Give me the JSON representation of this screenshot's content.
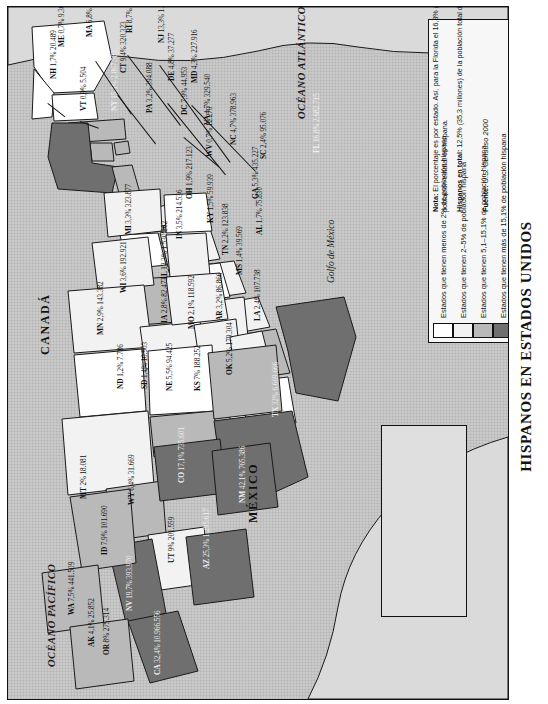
{
  "title": "HISPANOS EN ESTADOS UNIDOS",
  "colors": {
    "bin_lt2": "#ffffff",
    "bin_2_5": "#f2f2f2",
    "bin_5_15": "#b9b9b9",
    "bin_gt15": "#6f6f6f",
    "ocean": "#c9c9c9",
    "border": "#1a1a1a"
  },
  "legend": {
    "items": [
      {
        "swatch": "#ffffff",
        "label": "Estados que tienen menos de 2% de población hispana"
      },
      {
        "swatch": "#f2f2f2",
        "label": "Estados que tienen 2–5% de población hispana"
      },
      {
        "swatch": "#b9b9b9",
        "label": "Estados que tienen 5,1–15,1% de población hispana"
      },
      {
        "swatch": "#6f6f6f",
        "label": "Estados que tienen más de 15,1% de población hispana"
      }
    ],
    "note_label": "Nota:",
    "note_text": "El porcentaje es por estado. Así, para la Florida el 16,8% (2.682.715 personas) de la población estatal es hispana.",
    "total_label": "Hispanos en total:",
    "total_text": "12,5% (35,3 millones) de la población total de Estados Unidos",
    "source_label": "Fuente:",
    "source_text": "U.S. Censuso 2000"
  },
  "geography": {
    "ocean_atlantic": "OCÉANO ATLÁNTICO",
    "ocean_pacific": "OCÉANO PACÍFICO",
    "gulf": "Golfo de México",
    "canada": "CANADÁ",
    "mexico": "MÉXICO"
  },
  "chart_data": {
    "type": "map",
    "title": "HISPANOS EN ESTADOS UNIDOS",
    "unit": "porcentaje de población hispana por estado",
    "source": "U.S. Censuso 2000",
    "bins": [
      "<2%",
      "2–5%",
      "5,1–15,1%",
      ">15,1%"
    ],
    "states": [
      {
        "code": "WA",
        "pct": "7,5%",
        "count": "441.509",
        "bin": 2,
        "x": 60,
        "y": 608
      },
      {
        "code": "OR",
        "pct": "8%",
        "count": "275.314",
        "bin": 2,
        "x": 95,
        "y": 648
      },
      {
        "code": "CA",
        "pct": "32,4%",
        "count": "10.966.556",
        "bin": 3,
        "x": 146,
        "y": 668
      },
      {
        "code": "NV",
        "pct": "19,7%",
        "count": "393.970",
        "bin": 3,
        "x": 118,
        "y": 604
      },
      {
        "code": "ID",
        "pct": "7,9%",
        "count": "101.690",
        "bin": 2,
        "x": 93,
        "y": 548
      },
      {
        "code": "MT",
        "pct": "2%",
        "count": "18.081",
        "bin": 1,
        "x": 72,
        "y": 492
      },
      {
        "code": "WY",
        "pct": "6,4%",
        "count": "31.669",
        "bin": 2,
        "x": 120,
        "y": 498
      },
      {
        "code": "UT",
        "pct": "9%",
        "count": "201.559",
        "bin": 2,
        "x": 160,
        "y": 556
      },
      {
        "code": "AZ",
        "pct": "25,3%",
        "count": "1.295.617",
        "bin": 3,
        "x": 195,
        "y": 562
      },
      {
        "code": "CO",
        "pct": "17,1%",
        "count": "735.601",
        "bin": 3,
        "x": 170,
        "y": 476
      },
      {
        "code": "NM",
        "pct": "42,1%",
        "count": "765.386",
        "bin": 3,
        "x": 231,
        "y": 496
      },
      {
        "code": "ND",
        "pct": "1,2%",
        "count": "7.786",
        "bin": 0,
        "x": 109,
        "y": 382
      },
      {
        "code": "SD",
        "pct": "1,4%",
        "count": "10.903",
        "bin": 0,
        "x": 133,
        "y": 382
      },
      {
        "code": "NE",
        "pct": "5,5%",
        "count": "94.425",
        "bin": 2,
        "x": 158,
        "y": 384
      },
      {
        "code": "KS",
        "pct": "7%",
        "count": "188.252",
        "bin": 2,
        "x": 186,
        "y": 384
      },
      {
        "code": "OK",
        "pct": "5,2%",
        "count": "179.304",
        "bin": 2,
        "x": 218,
        "y": 368
      },
      {
        "code": "TX",
        "pct": "32%",
        "count": "6.669.666",
        "bin": 3,
        "x": 264,
        "y": 410
      },
      {
        "code": "MN",
        "pct": "2,9%",
        "count": "143.382",
        "bin": 1,
        "x": 89,
        "y": 328
      },
      {
        "code": "IA",
        "pct": "2,8%",
        "count": "82.473",
        "bin": 1,
        "x": 153,
        "y": 316
      },
      {
        "code": "MO",
        "pct": "2,1%",
        "count": "118.592",
        "bin": 1,
        "x": 180,
        "y": 322
      },
      {
        "code": "AR",
        "pct": "3,2%",
        "count": "86.866",
        "bin": 1,
        "x": 208,
        "y": 314
      },
      {
        "code": "LA",
        "pct": "2,4%",
        "count": "107.738",
        "bin": 1,
        "x": 246,
        "y": 314
      },
      {
        "code": "WI",
        "pct": "3,6%",
        "count": "192.921",
        "bin": 1,
        "x": 112,
        "y": 286
      },
      {
        "code": "IL",
        "pct": "12,3%",
        "count": "1.530.262",
        "bin": 2,
        "x": 153,
        "y": 272
      },
      {
        "code": "MS",
        "pct": "1,4%",
        "count": "39.569",
        "bin": 0,
        "x": 228,
        "y": 268
      },
      {
        "code": "MI",
        "pct": "3,3%",
        "count": "323.877",
        "bin": 1,
        "x": 117,
        "y": 228
      },
      {
        "code": "IN",
        "pct": "3,5%",
        "count": "214.536",
        "bin": 1,
        "x": 168,
        "y": 232
      },
      {
        "code": "OH",
        "pct": "1,9%",
        "count": "217.123",
        "bin": 0,
        "x": 178,
        "y": 192
      },
      {
        "code": "KY",
        "pct": "1,5%",
        "count": "59.939",
        "bin": 0,
        "x": 199,
        "y": 216
      },
      {
        "code": "TN",
        "pct": "2,2%",
        "count": "123.838",
        "bin": 1,
        "x": 214,
        "y": 248
      },
      {
        "code": "AL",
        "pct": "1,7%",
        "count": "75.830",
        "bin": 0,
        "x": 248,
        "y": 228
      },
      {
        "code": "GA",
        "pct": "5,3%",
        "count": "435.227",
        "bin": 2,
        "x": 244,
        "y": 192
      },
      {
        "code": "SC",
        "pct": "2,4%",
        "count": "95.076",
        "bin": 1,
        "x": 252,
        "y": 152
      },
      {
        "code": "NC",
        "pct": "4,7%",
        "count": "378.963",
        "bin": 1,
        "x": 222,
        "y": 138
      },
      {
        "code": "VA",
        "pct": "4,7%",
        "count": "329.540",
        "bin": 1,
        "x": 196,
        "y": 118
      },
      {
        "code": "WV",
        "pct": "0,7%",
        "count": "12.279",
        "bin": 0,
        "x": 198,
        "y": 150
      },
      {
        "code": "MD",
        "pct": "4,3%",
        "count": "227.916",
        "bin": 1,
        "x": 183,
        "y": 76
      },
      {
        "code": "DE",
        "pct": "4,8%",
        "count": "37.277",
        "bin": 1,
        "x": 160,
        "y": 74
      },
      {
        "code": "NJ",
        "pct": "13,3%",
        "count": "1.117.191",
        "bin": 2,
        "x": 150,
        "y": 36
      },
      {
        "code": "PA",
        "pct": "3,2%",
        "count": "394.088",
        "bin": 1,
        "x": 138,
        "y": 106
      },
      {
        "code": "NY",
        "pct": "15,1%",
        "count": "2.867.583",
        "bin": 3,
        "x": 103,
        "y": 104
      },
      {
        "code": "CT",
        "pct": "9,4%",
        "count": "320.323",
        "bin": 2,
        "x": 112,
        "y": 66
      },
      {
        "code": "RI",
        "pct": "8,7%",
        "count": "90.820",
        "bin": 2,
        "x": 118,
        "y": 26
      },
      {
        "code": "MA",
        "pct": "6,8%",
        "count": "428.729",
        "bin": 2,
        "x": 78,
        "y": 30
      },
      {
        "code": "NH",
        "pct": "1,7%",
        "count": "20.489",
        "bin": 0,
        "x": 42,
        "y": 72
      },
      {
        "code": "VT",
        "pct": "0,9%",
        "count": "5.504",
        "bin": 0,
        "x": 72,
        "y": 104
      },
      {
        "code": "ME",
        "pct": "0,7%",
        "count": "9.360",
        "bin": 0,
        "x": 50,
        "y": 40
      },
      {
        "code": "DC",
        "pct": "7,9%",
        "count": "44.953",
        "bin": 2,
        "x": 173,
        "y": 108
      },
      {
        "code": "FL",
        "pct": "16,8%",
        "count": "2.682.715",
        "bin": 3,
        "x": 305,
        "y": 146
      },
      {
        "code": "AK",
        "pct": "4,1%",
        "count": "25.852",
        "bin": 1,
        "x": 80,
        "y": 640
      },
      {
        "code": "HI",
        "pct": "7,2%",
        "count": "87.699",
        "bin": 2,
        "x": 400,
        "y": 512
      }
    ]
  }
}
